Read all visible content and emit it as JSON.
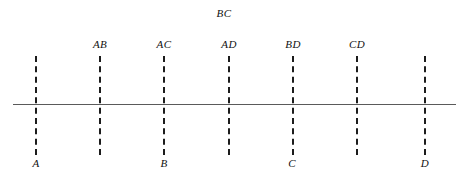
{
  "diagram": {
    "title_label": "BC",
    "title_x": 224,
    "title_y": 8,
    "axis": {
      "x_start": 13,
      "x_end": 456,
      "y": 104,
      "thickness": 1,
      "color": "#5a5a5a"
    },
    "cut_color": "#1c1c1c",
    "cut_top": 56,
    "cut_bottom": 155,
    "cut_labels_y": 39,
    "point_labels_y": 158,
    "cuts": [
      {
        "label": "",
        "x": 35
      },
      {
        "label": "AB",
        "x": 99
      },
      {
        "label": "AC",
        "x": 163
      },
      {
        "label": "AD",
        "x": 228
      },
      {
        "label": "BD",
        "x": 292
      },
      {
        "label": "CD",
        "x": 356
      },
      {
        "label": "",
        "x": 424
      }
    ],
    "points": [
      {
        "label": "A",
        "x": 36
      },
      {
        "label": "B",
        "x": 164
      },
      {
        "label": "C",
        "x": 292
      },
      {
        "label": "D",
        "x": 425
      }
    ]
  }
}
